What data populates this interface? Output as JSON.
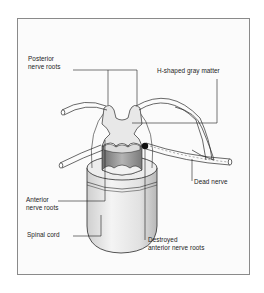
{
  "diagram": {
    "labels": {
      "posterior_roots_line1": "Posterior",
      "posterior_roots_line2": "nerve roots",
      "gray_matter": "H-shaped gray matter",
      "dead_nerve": "Dead nerve",
      "anterior_roots_line1": "Anterior",
      "anterior_roots_line2": "nerve roots",
      "spinal_cord": "Spinal cord",
      "destroyed_line1": "Destroyed",
      "destroyed_line2": "anterior nerve roots"
    },
    "colors": {
      "line": "#2a2a2a",
      "gray_matter": "#e6e6e6",
      "shadow": "#8c8c8c",
      "frame": "#8a8a8a",
      "background": "#fbfbfb"
    }
  }
}
